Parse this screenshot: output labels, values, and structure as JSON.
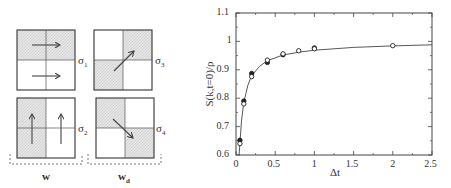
{
  "diagram": {
    "panels": [
      {
        "id": "sigma1",
        "label": "σ",
        "sub": "1"
      },
      {
        "id": "sigma3",
        "label": "σ",
        "sub": "3"
      },
      {
        "id": "sigma2",
        "label": "σ",
        "sub": "2"
      },
      {
        "id": "sigma4",
        "label": "σ",
        "sub": "4"
      }
    ],
    "group_labels": {
      "w": "w",
      "wd_main": "w",
      "wd_sub": "d"
    }
  },
  "chart_data": {
    "type": "scatter",
    "title": "",
    "xlabel": "Δt",
    "ylabel": "S(k,t=0)/ρ",
    "xlim": [
      0,
      2.5
    ],
    "ylim": [
      0.6,
      1.1
    ],
    "xticks": [
      "0",
      "0.5",
      "1",
      "1.5",
      "2",
      "2.5"
    ],
    "yticks": [
      "0.6",
      "0.7",
      "0.8",
      "0.9",
      "1",
      "1.1"
    ],
    "grid": false,
    "legend": null,
    "series": [
      {
        "name": "filled",
        "marker": "filled-circle",
        "x": [
          0.05,
          0.1,
          0.2,
          0.4,
          0.6,
          1.0
        ],
        "y": [
          0.652,
          0.79,
          0.887,
          0.926,
          0.953,
          0.977
        ]
      },
      {
        "name": "open",
        "marker": "open-circle",
        "x": [
          0.05,
          0.1,
          0.2,
          0.4,
          0.6,
          0.8,
          1.0,
          2.0
        ],
        "y": [
          0.64,
          0.78,
          0.876,
          0.934,
          0.956,
          0.967,
          0.974,
          0.985
        ]
      },
      {
        "name": "fit",
        "marker": "line",
        "x": [
          0.04,
          0.05,
          0.07,
          0.1,
          0.15,
          0.2,
          0.3,
          0.4,
          0.6,
          0.8,
          1.0,
          1.5,
          2.0,
          2.5
        ],
        "y": [
          0.6,
          0.64,
          0.72,
          0.785,
          0.845,
          0.88,
          0.912,
          0.932,
          0.952,
          0.962,
          0.969,
          0.979,
          0.984,
          0.988
        ]
      }
    ]
  }
}
